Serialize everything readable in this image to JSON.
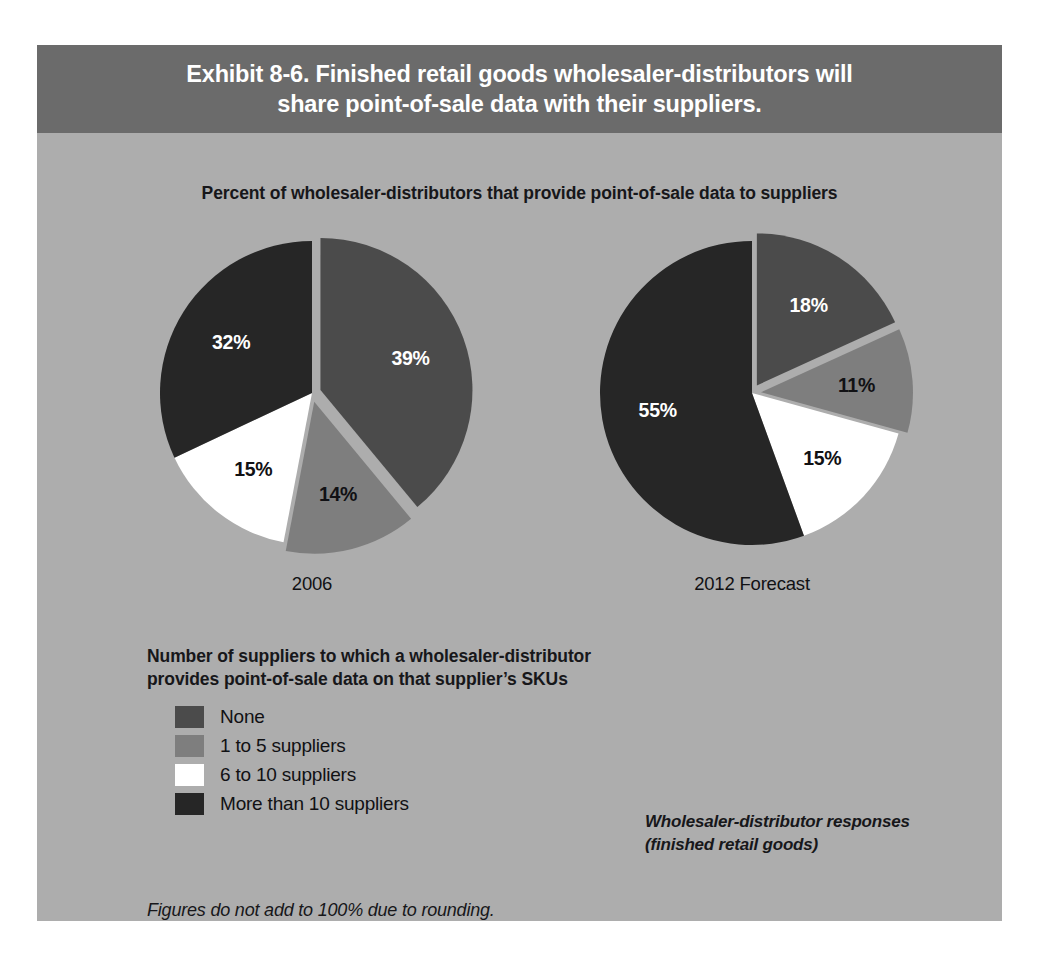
{
  "exhibit": {
    "title_line1": "Exhibit 8-6. Finished retail goods wholesaler-distributors will",
    "title_line2": "share point-of-sale data with their suppliers.",
    "subtitle": "Percent of wholesaler-distributors that provide point-of-sale data to suppliers",
    "legend_heading_line1": "Number of suppliers to which a wholesaler-distributor",
    "legend_heading_line2": "provides point-of-sale data on that supplier’s SKUs",
    "source_note_line1": "Wholesaler-distributor responses",
    "source_note_line2": "(finished retail goods)",
    "rounding_note": "Figures do not add to 100% due to rounding.",
    "panel_bg": "#adadad",
    "title_bar_bg": "#6b6b6b"
  },
  "legend": {
    "items": [
      {
        "label": "None",
        "color": "#4b4b4b"
      },
      {
        "label": "1 to 5 suppliers",
        "color": "#7e7e7e"
      },
      {
        "label": "6 to 10 suppliers",
        "color": "#ffffff"
      },
      {
        "label": "More than 10 suppliers",
        "color": "#262626"
      }
    ]
  },
  "chart_data": [
    {
      "type": "pie",
      "title": "2006",
      "categories": [
        "None",
        "1 to 5 suppliers",
        "6 to 10 suppliers",
        "More than 10 suppliers"
      ],
      "values": [
        39,
        14,
        15,
        32
      ],
      "labels": [
        "39%",
        "14%",
        "15%",
        "32%"
      ],
      "colors": [
        "#4b4b4b",
        "#7e7e7e",
        "#ffffff",
        "#262626"
      ],
      "label_colors": [
        "#ffffff",
        "#111114",
        "#111114",
        "#ffffff"
      ],
      "exploded": [
        true,
        true,
        false,
        false
      ],
      "legend": "Number of suppliers to which a wholesaler-distributor provides point-of-sale data on that supplier’s SKUs"
    },
    {
      "type": "pie",
      "title": "2012 Forecast",
      "categories": [
        "None",
        "1 to 5 suppliers",
        "6 to 10 suppliers",
        "More than 10 suppliers"
      ],
      "values": [
        18,
        11,
        15,
        55
      ],
      "labels": [
        "18%",
        "11%",
        "15%",
        "55%"
      ],
      "colors": [
        "#4b4b4b",
        "#7e7e7e",
        "#ffffff",
        "#262626"
      ],
      "label_colors": [
        "#ffffff",
        "#111114",
        "#111114",
        "#ffffff"
      ],
      "exploded": [
        true,
        true,
        false,
        false
      ],
      "legend": "Number of suppliers to which a wholesaler-distributor provides point-of-sale data on that supplier’s SKUs"
    }
  ]
}
